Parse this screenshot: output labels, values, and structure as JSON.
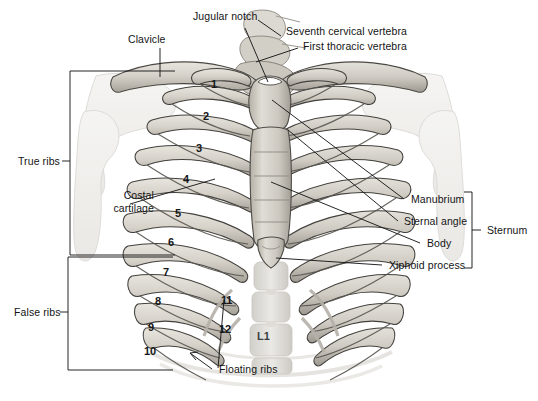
{
  "figure": {
    "background_color": "#ffffff",
    "line_color": "#1a1a1a",
    "text_color": "#141414",
    "bone_fill": "#d9d6cf",
    "bone_shadow": "#a9a49a",
    "ghost_fill": "#eeeeea"
  },
  "labels": {
    "clavicle": "Clavicle",
    "jugular_notch": "Jugular notch",
    "seventh_cervical_vertebra": "Seventh cervical vertebra",
    "first_thoracic_vertebra": "First thoracic vertebra",
    "true_ribs": "True ribs",
    "false_ribs": "False ribs",
    "costal_cartilage_line1": "Costal",
    "costal_cartilage_line2": "cartilage",
    "manubrium": "Manubrium",
    "sternal_angle": "Sternal angle",
    "body": "Body",
    "xiphoid_process": "Xiphoid process",
    "sternum": "Sternum",
    "floating_ribs": "Floating ribs",
    "lumbar_vertebra": "L1"
  },
  "rib_numbers": [
    {
      "id": "rib-1",
      "text": "1",
      "x": 211,
      "y": 78
    },
    {
      "id": "rib-2",
      "text": "2",
      "x": 203,
      "y": 110
    },
    {
      "id": "rib-3",
      "text": "3",
      "x": 196,
      "y": 142
    },
    {
      "id": "rib-4",
      "text": "4",
      "x": 183,
      "y": 173
    },
    {
      "id": "rib-5",
      "text": "5",
      "x": 175,
      "y": 207
    },
    {
      "id": "rib-6",
      "text": "6",
      "x": 168,
      "y": 236
    },
    {
      "id": "rib-7",
      "text": "7",
      "x": 163,
      "y": 266
    },
    {
      "id": "rib-8",
      "text": "8",
      "x": 155,
      "y": 295
    },
    {
      "id": "rib-9",
      "text": "9",
      "x": 148,
      "y": 321
    },
    {
      "id": "rib-10",
      "text": "10",
      "x": 144,
      "y": 345
    },
    {
      "id": "rib-11",
      "text": "11",
      "x": 221,
      "y": 294
    },
    {
      "id": "rib-12",
      "text": "12",
      "x": 219,
      "y": 323
    }
  ],
  "brackets": [
    {
      "id": "true-ribs-bracket",
      "label": "True ribs",
      "x": 70,
      "y_top": 71,
      "y_bottom": 255,
      "width": 105
    },
    {
      "id": "false-ribs-bracket",
      "label": "False ribs",
      "x": 68,
      "y_top": 257,
      "y_bottom": 370,
      "width": 105
    },
    {
      "id": "sternum-bracket",
      "label": "Sternum",
      "x": 470,
      "y_top": 192,
      "y_bottom": 268,
      "width": 10
    }
  ]
}
